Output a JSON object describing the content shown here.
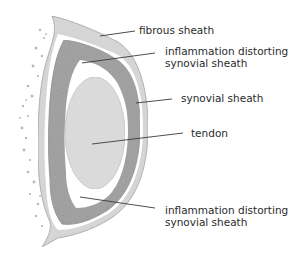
{
  "diagram": {
    "colors": {
      "fibrous_sheath": "#d6d6d6",
      "fibrous_sheath_edge": "#a9a9a9",
      "synovial_sheath": "#9c9c9c",
      "gap": "#ffffff",
      "tendon": "#dedede",
      "leader": "#3a3a3a",
      "dots": "#b5b5b5"
    },
    "labels": [
      {
        "id": "fibrous-sheath",
        "lines": [
          "fibrous sheath"
        ]
      },
      {
        "id": "inflammation-top",
        "lines": [
          "inflammation distorting",
          "synovial sheath"
        ]
      },
      {
        "id": "synovial-sheath",
        "lines": [
          "synovial sheath"
        ]
      },
      {
        "id": "tendon",
        "lines": [
          "tendon"
        ]
      },
      {
        "id": "inflammation-bottom",
        "lines": [
          "inflammation distorting",
          "synovial sheath"
        ]
      }
    ]
  }
}
